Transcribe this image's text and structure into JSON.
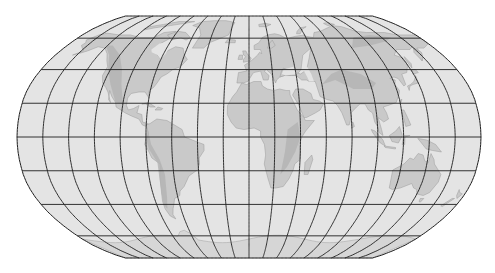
{
  "map": {
    "projection": "Robinson",
    "graticule": {
      "meridian_step_deg": 20,
      "parallel_step_deg": 22.5,
      "line_color": "#1e1e1e"
    },
    "colors": {
      "background": "#ffffff",
      "ocean": "#e4e4e4",
      "land": "#c9c9c9",
      "relief": "#b3b3b3",
      "ice": "#d6d6d6"
    },
    "layout": {
      "center_x": 249,
      "center_y": 137,
      "half_height_px": 121,
      "half_width_px": 232
    },
    "features": [
      {
        "name": "North America",
        "type": "land"
      },
      {
        "name": "South America",
        "type": "land"
      },
      {
        "name": "Greenland",
        "type": "land"
      },
      {
        "name": "Europe",
        "type": "land"
      },
      {
        "name": "Africa",
        "type": "land"
      },
      {
        "name": "Asia",
        "type": "land"
      },
      {
        "name": "Australia",
        "type": "land"
      },
      {
        "name": "Antarctica",
        "type": "ice"
      }
    ]
  }
}
